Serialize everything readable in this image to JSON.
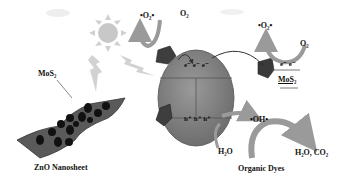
{
  "diagram": {
    "labels": {
      "superoxide_left": "•O₂•",
      "o2_left": "O₂",
      "superoxide_right": "•O₂•",
      "o2_right": "O₂",
      "electrons_zno": "e⁻ e⁻ e⁻",
      "electrons_mos2": "e⁻ e⁻",
      "mos2_right": "MoS₂",
      "mos2_left": "MoS₂",
      "holes": "h⁺ h⁺ h⁺",
      "hydroxyl": "•OH•",
      "water": "H₂O",
      "products": "H₂O, CO₂",
      "organic_dyes": "Organic Dyes",
      "zno_nanosheet": "ZnO Nanosheet"
    },
    "colors": {
      "sphere": "#8a8a8a",
      "sheet": "#5a5a5a",
      "dots": "#111111",
      "arrows": "#9a9a9a",
      "sun": "#c8c8c8"
    }
  }
}
